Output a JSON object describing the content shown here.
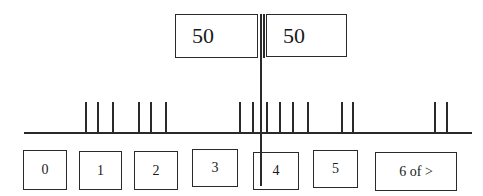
{
  "top_values": [
    {
      "label": "50",
      "x": 175,
      "y": 14,
      "w": 83,
      "h": 44
    },
    {
      "label": "50",
      "x": 266,
      "y": 14,
      "w": 81,
      "h": 43
    }
  ],
  "slots": [
    {
      "label": "0",
      "x": 23,
      "y": 150,
      "w": 44,
      "h": 40
    },
    {
      "label": "1",
      "x": 79,
      "y": 151,
      "w": 43,
      "h": 39
    },
    {
      "label": "2",
      "x": 134,
      "y": 151,
      "w": 44,
      "h": 39
    },
    {
      "label": "3",
      "x": 192,
      "y": 149,
      "w": 46,
      "h": 38
    },
    {
      "label": "4",
      "x": 253,
      "y": 152,
      "w": 46,
      "h": 38
    },
    {
      "label": "5",
      "x": 313,
      "y": 150,
      "w": 45,
      "h": 38
    },
    {
      "label": "6 of >",
      "x": 375,
      "y": 152,
      "w": 82,
      "h": 39
    }
  ],
  "timeline": {
    "baseline": {
      "x1": 24,
      "x2": 472,
      "y": 132
    },
    "tick_top": 102,
    "ticks_x": [
      85,
      97,
      112,
      138,
      150,
      165,
      239,
      252,
      266,
      279,
      292,
      307,
      341,
      352,
      434,
      446
    ]
  },
  "divider": {
    "x": 260,
    "x2": 263,
    "y_top": 14,
    "y_double_end": 58,
    "y_bottom": 186
  }
}
